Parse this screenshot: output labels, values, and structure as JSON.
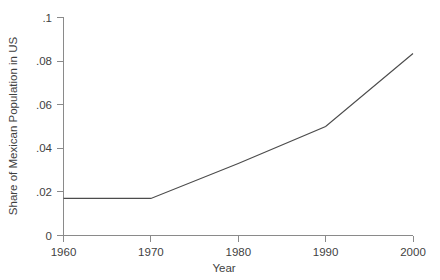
{
  "chart_data": {
    "type": "line",
    "title": "",
    "subtitle": "",
    "xlabel": "Year",
    "ylabel": "Share of Mexican Population in US",
    "x": [
      1960,
      1970,
      1980,
      1990,
      2000
    ],
    "values": [
      0.017,
      0.017,
      0.033,
      0.05,
      0.0835
    ],
    "series": [
      {
        "name": "Share of Mexican Population in US",
        "values": [
          0.017,
          0.017,
          0.033,
          0.05,
          0.0835
        ],
        "color": "#4c4c4c"
      }
    ],
    "xlim": [
      1960,
      2000
    ],
    "ylim": [
      0,
      0.1
    ],
    "xticks": [
      1960,
      1970,
      1980,
      1990,
      2000
    ],
    "yticks": [
      0,
      0.02,
      0.04,
      0.06,
      0.08,
      0.1
    ],
    "xtick_labels": [
      "1960",
      "1970",
      "1980",
      "1990",
      "2000"
    ],
    "ytick_labels": [
      "0",
      ".02",
      ".04",
      ".06",
      ".08",
      ".1"
    ],
    "grid": false,
    "legend": false,
    "legend_position": "none",
    "annotations": [],
    "background_color": "#ffffff",
    "axis_color": "#8a8a8a",
    "text_color": "#3f3f3f"
  }
}
